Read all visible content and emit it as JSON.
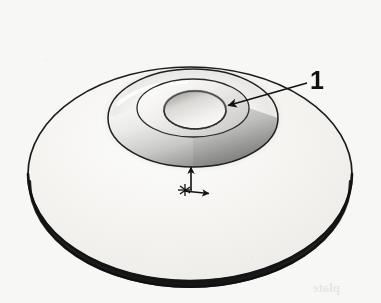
{
  "figure": {
    "kind": "engineering-line-drawing",
    "background_color": "#f7f7f5",
    "ink_color": "#1a1a1a",
    "callouts": [
      {
        "id": "callout-1",
        "label": "1",
        "label_x": 310,
        "label_y": 68,
        "points_to": "central bore / hub inner edge",
        "leader_start_x": 307,
        "leader_start_y": 83,
        "leader_end_x": 226,
        "leader_end_y": 106
      }
    ],
    "axis_marker": {
      "name": "coordinate-origin-marker",
      "origin_x": 191,
      "origin_y": 190,
      "vertical_arrow_label": "",
      "horizontal_arrow_label": "",
      "vertical_tip_y": 163,
      "horizontal_tip_x": 210
    },
    "geometry": {
      "disc_center_x": 190,
      "disc_center_y": 174,
      "disc_rx": 162,
      "disc_ry": 107,
      "disc_thickness": 9,
      "hub_base_center_x": 193,
      "hub_base_center_y": 118,
      "hub_base_rx": 85,
      "hub_base_ry": 49,
      "hub_top_center_x": 193,
      "hub_top_center_y": 108,
      "hub_top_rx": 56,
      "hub_top_ry": 29,
      "bore_center_x": 195,
      "bore_center_y": 110,
      "bore_rx": 31,
      "bore_ry": 19
    },
    "shading": {
      "disc_face": "#f2f1ee",
      "hub_highlight": "#fbfbfa",
      "hub_shadow": "#8d8d8d",
      "bore_inner": "#e6e5e2",
      "edge_dark": "#1c1c1c"
    }
  }
}
